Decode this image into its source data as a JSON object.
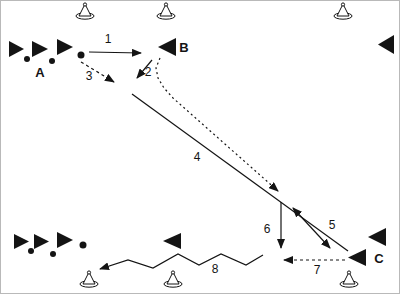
{
  "figure": {
    "background": "#ffffff",
    "ink": "#141414",
    "border_color": "#b9b9b9",
    "labels": [
      {
        "name": "label-a",
        "text": "A",
        "x": 39,
        "y": 71,
        "bold": true
      },
      {
        "name": "label-b",
        "text": "B",
        "x": 183,
        "y": 46,
        "bold": true
      },
      {
        "name": "label-c",
        "text": "C",
        "x": 378,
        "y": 257,
        "bold": true
      },
      {
        "name": "label-step-1",
        "text": "1",
        "x": 107,
        "y": 38,
        "bold": false
      },
      {
        "name": "label-step-2",
        "text": "2",
        "x": 147,
        "y": 71,
        "bold": false
      },
      {
        "name": "label-step-3",
        "text": "3",
        "x": 88,
        "y": 75,
        "bold": false
      },
      {
        "name": "label-step-4",
        "text": "4",
        "x": 196,
        "y": 156,
        "bold": false
      },
      {
        "name": "label-step-5",
        "text": "5",
        "x": 331,
        "y": 224,
        "bold": false
      },
      {
        "name": "label-step-6",
        "text": "6",
        "x": 266,
        "y": 228,
        "bold": false
      },
      {
        "name": "label-step-7",
        "text": "7",
        "x": 316,
        "y": 269,
        "bold": false
      },
      {
        "name": "label-step-8",
        "text": "8",
        "x": 214,
        "y": 268,
        "bold": false
      }
    ],
    "cones": [
      {
        "name": "cone-top-1",
        "x": 84,
        "base_y": 15
      },
      {
        "name": "cone-top-2",
        "x": 165,
        "base_y": 15
      },
      {
        "name": "cone-top-3",
        "x": 342,
        "base_y": 15
      },
      {
        "name": "cone-bottom-1",
        "x": 88,
        "base_y": 283
      },
      {
        "name": "cone-bottom-2",
        "x": 172,
        "base_y": 283
      },
      {
        "name": "cone-bottom-3",
        "x": 348,
        "base_y": 283
      }
    ],
    "flocks": [
      {
        "name": "flock-top-left",
        "triangles": [
          {
            "x": 8,
            "y": 40,
            "w": 15,
            "h": 16
          },
          {
            "x": 31,
            "y": 40,
            "w": 16,
            "h": 16
          },
          {
            "x": 56,
            "y": 38,
            "w": 16,
            "h": 16
          }
        ],
        "dots": [
          {
            "x": 26,
            "y": 58,
            "r": 3
          },
          {
            "x": 51,
            "y": 60,
            "r": 3
          },
          {
            "x": 80,
            "y": 54,
            "r": 3.5
          }
        ]
      },
      {
        "name": "flock-bottom-left",
        "triangles": [
          {
            "x": 13,
            "y": 233,
            "w": 15,
            "h": 15
          },
          {
            "x": 33,
            "y": 233,
            "w": 15,
            "h": 15
          },
          {
            "x": 56,
            "y": 231,
            "w": 16,
            "h": 16
          }
        ],
        "dots": [
          {
            "x": 30,
            "y": 250,
            "r": 3
          },
          {
            "x": 52,
            "y": 253,
            "r": 3
          },
          {
            "x": 82,
            "y": 244,
            "r": 3.5
          }
        ]
      }
    ],
    "pointers": [
      {
        "name": "pointer-b",
        "x": 157,
        "y": 37,
        "w": 18,
        "h": 18,
        "dir": "left"
      },
      {
        "name": "pointer-top-right",
        "x": 377,
        "y": 34,
        "w": 16,
        "h": 19,
        "dir": "left"
      },
      {
        "name": "pointer-bottom-middle",
        "x": 162,
        "y": 232,
        "w": 18,
        "h": 16,
        "dir": "left"
      },
      {
        "name": "pointer-c-upper",
        "x": 367,
        "y": 227,
        "w": 18,
        "h": 18,
        "dir": "left"
      },
      {
        "name": "pointer-c-lower",
        "x": 347,
        "y": 248,
        "w": 18,
        "h": 17,
        "dir": "left"
      }
    ],
    "paths": [
      {
        "name": "path-1",
        "points": [
          [
            88,
            51
          ],
          [
            140,
            52
          ]
        ],
        "dash": "",
        "arrow_start": false,
        "arrow_end": true
      },
      {
        "name": "path-2",
        "points": [
          [
            151,
            59
          ],
          [
            136,
            77
          ]
        ],
        "dash": "",
        "arrow_start": false,
        "arrow_end": true
      },
      {
        "name": "path-3",
        "points": [
          [
            80,
            61
          ],
          [
            113,
            81
          ]
        ],
        "dash": "3 3",
        "arrow_start": false,
        "arrow_end": true
      },
      {
        "name": "path-return-from-b",
        "points": [
          [
            159,
            57
          ],
          [
            155,
            67
          ],
          [
            157,
            77
          ],
          [
            163,
            87
          ],
          [
            172,
            97
          ],
          [
            277,
            190
          ]
        ],
        "dash": "2 3",
        "arrow_start": false,
        "arrow_end": true
      },
      {
        "name": "path-4",
        "points": [
          [
            131,
            93
          ],
          [
            347,
            250
          ]
        ],
        "dash": "",
        "arrow_start": false,
        "arrow_end": false
      },
      {
        "name": "path-5",
        "points": [
          [
            292,
            207
          ],
          [
            329,
            247
          ]
        ],
        "dash": "",
        "arrow_start": true,
        "arrow_end": true
      },
      {
        "name": "path-6",
        "points": [
          [
            280,
            201
          ],
          [
            280,
            247
          ]
        ],
        "dash": "",
        "arrow_start": false,
        "arrow_end": true
      },
      {
        "name": "path-7",
        "points": [
          [
            344,
            259
          ],
          [
            283,
            259
          ]
        ],
        "dash": "3 3",
        "arrow_start": false,
        "arrow_end": true
      },
      {
        "name": "path-8",
        "points": [
          [
            262,
            254
          ],
          [
            245,
            264
          ],
          [
            220,
            253
          ],
          [
            198,
            264
          ],
          [
            177,
            253
          ],
          [
            152,
            267
          ],
          [
            127,
            259
          ],
          [
            99,
            268
          ]
        ],
        "dash": "",
        "arrow_start": false,
        "arrow_end": true
      }
    ]
  }
}
